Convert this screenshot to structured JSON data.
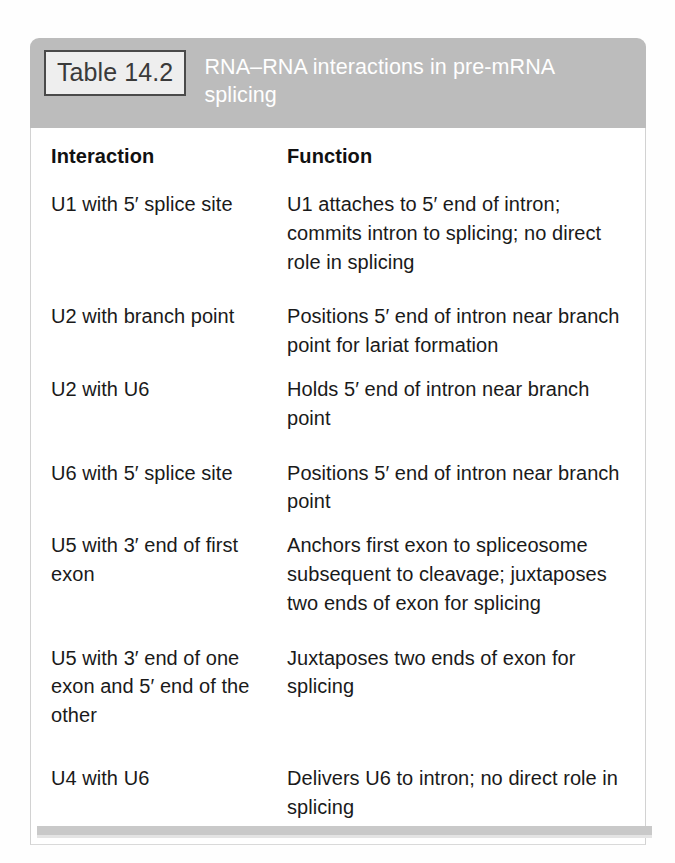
{
  "table": {
    "badge_label": "Table 14.2",
    "title": "RNA–RNA interactions in pre-mRNA splicing",
    "columns": {
      "interaction": "Interaction",
      "function": "Function"
    },
    "rows": [
      {
        "interaction": "U1 with 5′ splice site",
        "function": "U1 attaches to 5′ end of intron; commits intron to splicing; no direct role in splicing"
      },
      {
        "interaction": "U2 with branch point",
        "function": "Positions 5′ end of intron near branch point for lariat formation"
      },
      {
        "interaction": "U2 with U6",
        "function": "Holds 5′ end of intron near branch point"
      },
      {
        "interaction": "U6 with 5′ splice site",
        "function": "Positions 5′ end of intron near branch point"
      },
      {
        "interaction": "U5 with 3′ end of first exon",
        "function": "Anchors first exon to spliceosome subsequent to cleavage; juxtaposes two ends of exon for splicing"
      },
      {
        "interaction": "U5 with 3′ end of one exon and 5′ end of the other",
        "function": "Juxtaposes two ends of exon for splicing"
      },
      {
        "interaction": "U4 with U6",
        "function": "Delivers U6 to intron; no direct role in splicing"
      }
    ],
    "colors": {
      "header_band": "#bcbcbc",
      "badge_background": "#eeeeee",
      "badge_border": "#4a4a4a",
      "title_text": "#ffffff",
      "body_background": "#ffffff",
      "body_text": "#1a1a1a",
      "card_border": "#d2d2d2",
      "shadow_bar": "#c9c9c9"
    }
  }
}
